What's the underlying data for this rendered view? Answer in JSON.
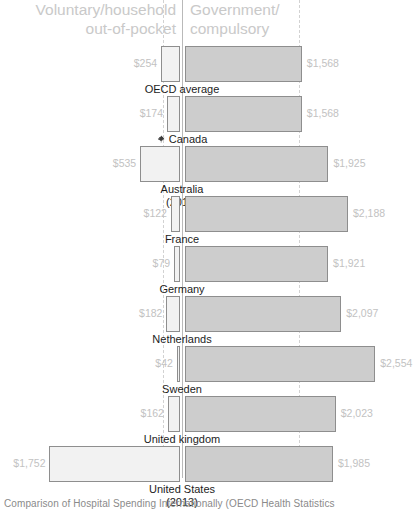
{
  "header": {
    "left_label": "Voluntary/household\nout-of-pocket",
    "left_line1": "Voluntary/household",
    "left_line2": "out-of-pocket",
    "right_line1": "Government/",
    "right_line2": "compulsory"
  },
  "caption": {
    "text": "Comparison of Hospital Spending Internationally (OECD Health Statistics"
  },
  "colors": {
    "header_text": "#c9c9c9",
    "value_label": "#c2c2c2",
    "category_text": "#1c1c1c",
    "bar_left_fill": "#f2f2f2",
    "bar_right_fill": "#cdcdcd",
    "bar_stroke": "#8e8e8e",
    "axis_line": "#b9b9b9",
    "gridline": "#d2d2d2"
  },
  "chart_data": {
    "type": "bar",
    "title": "Comparison of Hospital Spending Internationally",
    "subtype": "diverging-horizontal",
    "xlabel": "",
    "ylabel": "",
    "grid": true,
    "gridlines_x": [
      254,
      1568
    ],
    "legend_position": "top",
    "categories": [
      "OECD average",
      "Canada",
      "Australia (2015)",
      "France",
      "Germany",
      "Netherlands",
      "Sweden",
      "United kingdom",
      "United States (2013)"
    ],
    "series": [
      {
        "name": "Voluntary/household out-of-pocket",
        "direction": "left",
        "values": [
          254,
          174,
          535,
          122,
          79,
          182,
          42,
          162,
          1752
        ],
        "labels": [
          "$254",
          "$174",
          "$535",
          "$122",
          "$79",
          "$182",
          "$42",
          "$162",
          "$1,752"
        ]
      },
      {
        "name": "Government/compulsory",
        "direction": "right",
        "values": [
          1568,
          1568,
          1925,
          2188,
          1921,
          2097,
          2554,
          2023,
          1985
        ],
        "labels": [
          "$1,568",
          "$1,568",
          "$1,925",
          "$2,188",
          "$1,921",
          "$2,097",
          "$2,554",
          "$2,023",
          "$1,985"
        ]
      }
    ],
    "units": "USD per capita"
  },
  "rows": [
    {
      "category": "OECD average",
      "category_line2": "",
      "left_label": "$254",
      "right_label": "$1,568",
      "left_value": 254,
      "right_value": 1568,
      "flag": ""
    },
    {
      "category": "Canada",
      "category_line2": "",
      "left_label": "$174",
      "right_label": "$1,568",
      "left_value": 174,
      "right_value": 1568,
      "flag": "maple-leaf"
    },
    {
      "category": "Australia",
      "category_line2": "(2015)",
      "left_label": "$535",
      "right_label": "$1,925",
      "left_value": 535,
      "right_value": 1925,
      "flag": ""
    },
    {
      "category": "France",
      "category_line2": "",
      "left_label": "$122",
      "right_label": "$2,188",
      "left_value": 122,
      "right_value": 2188,
      "flag": ""
    },
    {
      "category": "Germany",
      "category_line2": "",
      "left_label": "$79",
      "right_label": "$1,921",
      "left_value": 79,
      "right_value": 1921,
      "flag": ""
    },
    {
      "category": "Netherlands",
      "category_line2": "",
      "left_label": "$182",
      "right_label": "$2,097",
      "left_value": 182,
      "right_value": 2097,
      "flag": ""
    },
    {
      "category": "Sweden",
      "category_line2": "",
      "left_label": "$42",
      "right_label": "$2,554",
      "left_value": 42,
      "right_value": 2554,
      "flag": ""
    },
    {
      "category": "United kingdom",
      "category_line2": "",
      "left_label": "$162",
      "right_label": "$2,023",
      "left_value": 162,
      "right_value": 2023,
      "flag": ""
    },
    {
      "category": "United States",
      "category_line2": "(2013)",
      "left_label": "$1,752",
      "right_label": "$1,985",
      "left_value": 1752,
      "right_value": 1985,
      "flag": ""
    }
  ]
}
